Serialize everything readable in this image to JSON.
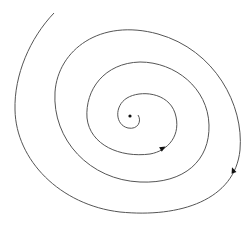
{
  "diagram": {
    "type": "phase-portrait-spiral",
    "direction": "inward",
    "stroke_color": "#555555",
    "point_color": "#111111",
    "arrow_count": 2,
    "fixed_point": {
      "label": "",
      "kind": "stable focus"
    }
  }
}
